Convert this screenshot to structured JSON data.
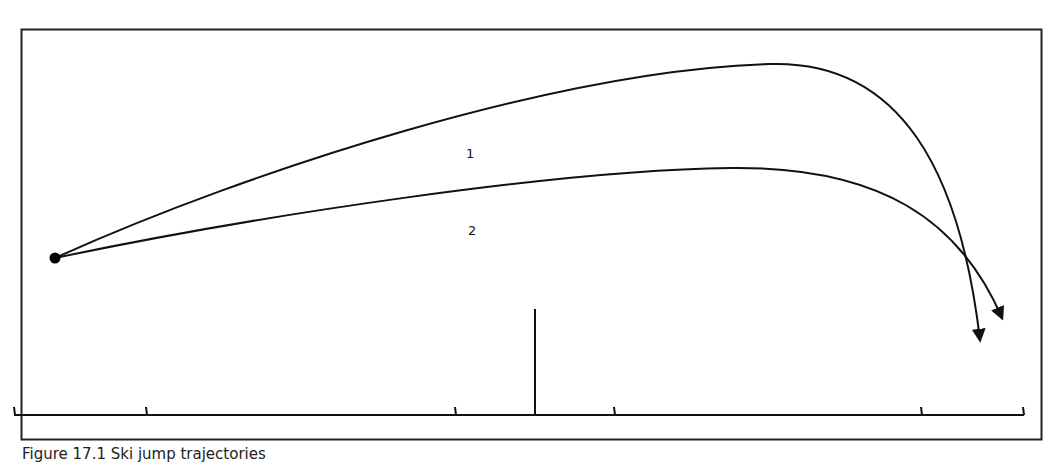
{
  "diagram": {
    "type": "trajectory-diagram",
    "trajectories": [
      {
        "label": "1",
        "description": "higher arc, lands nearer, steeper descent"
      },
      {
        "label": "2",
        "description": "flatter arc, lands farther"
      }
    ],
    "start_point": "launch-point",
    "ground_ticks_count": 6,
    "center_marker": "vertical-reference-line"
  },
  "caption": "Figure 17.1   Ski jump trajectories",
  "colors": {
    "line": "#111111",
    "frame": "#222222",
    "background": "#ffffff"
  }
}
